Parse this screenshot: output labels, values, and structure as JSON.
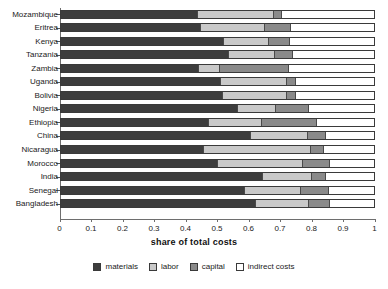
{
  "chart_data": {
    "type": "bar",
    "orientation": "horizontal",
    "stacked": true,
    "title": "",
    "xlabel": "share of total costs",
    "ylabel": "",
    "xlim": [
      0,
      1
    ],
    "xticks": [
      "0",
      "0.1",
      "0.2",
      "0.3",
      "0.4",
      "0.5",
      "0.6",
      "0.7",
      "0.8",
      "0.9",
      "1"
    ],
    "grid": false,
    "legend_position": "bottom",
    "categories": [
      "Mozambique",
      "Eritrea",
      "Kenya",
      "Tanzania",
      "Zambia",
      "Uganda",
      "Bolivia",
      "Nigeria",
      "Ethiopia",
      "China",
      "Nicaragua",
      "Morocco",
      "India",
      "Senegal",
      "Bangladesh"
    ],
    "series": [
      {
        "name": "materials",
        "color": "#3d3d3d",
        "values": [
          0.435,
          0.445,
          0.52,
          0.535,
          0.44,
          0.51,
          0.515,
          0.565,
          0.47,
          0.605,
          0.455,
          0.5,
          0.645,
          0.585,
          0.62
        ]
      },
      {
        "name": "labor",
        "color": "#c9c9c9",
        "values": [
          0.248,
          0.207,
          0.145,
          0.15,
          0.07,
          0.215,
          0.21,
          0.125,
          0.175,
          0.185,
          0.345,
          0.275,
          0.16,
          0.185,
          0.175
        ]
      },
      {
        "name": "capital",
        "color": "#8a8a8a",
        "values": [
          0.026,
          0.083,
          0.067,
          0.057,
          0.22,
          0.029,
          0.026,
          0.105,
          0.175,
          0.057,
          0.042,
          0.085,
          0.042,
          0.089,
          0.067
        ]
      },
      {
        "name": "indirect costs",
        "color": "#ffffff",
        "values": [
          0.291,
          0.265,
          0.268,
          0.258,
          0.27,
          0.246,
          0.249,
          0.205,
          0.18,
          0.153,
          0.158,
          0.14,
          0.153,
          0.141,
          0.138
        ]
      }
    ]
  },
  "legend": {
    "items": [
      {
        "label": "materials"
      },
      {
        "label": "labor"
      },
      {
        "label": "capital"
      },
      {
        "label": "indirect costs"
      }
    ]
  }
}
